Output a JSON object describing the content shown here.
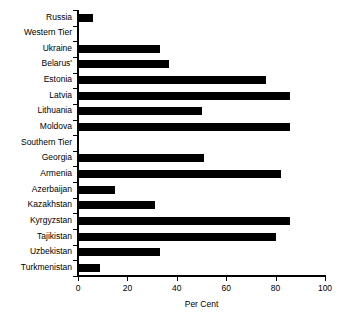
{
  "chart_data": {
    "type": "bar",
    "orientation": "horizontal",
    "title": "",
    "subtitle": "",
    "xlabel": "Per Cent",
    "ylabel": "",
    "xlim": [
      0,
      100
    ],
    "xticks": [
      0,
      20,
      40,
      60,
      80,
      100
    ],
    "xtick_labels": [
      "0",
      "20",
      "40",
      "60",
      "80",
      "100"
    ],
    "grid": false,
    "legend": null,
    "bar_color": "#000000",
    "background_color": "#ffffff",
    "axis_color": "#000000",
    "categories": [
      "Russia",
      "Western Tier",
      "Ukraine",
      "Belarus'",
      "Estonia",
      "Latvia",
      "Lithuania",
      "Moldova",
      "Southern Tier",
      "Georgia",
      "Armenia",
      "Azerbaijan",
      "Kazakhstan",
      "Kyrgyzstan",
      "Tajikistan",
      "Uzbekistan",
      "Turkmenistan"
    ],
    "values": [
      6,
      0,
      33,
      37,
      76,
      86,
      50,
      86,
      0,
      51,
      82,
      15,
      31,
      86,
      80,
      33,
      9
    ],
    "group_headers": [
      "Western Tier",
      "Southern Tier"
    ]
  }
}
